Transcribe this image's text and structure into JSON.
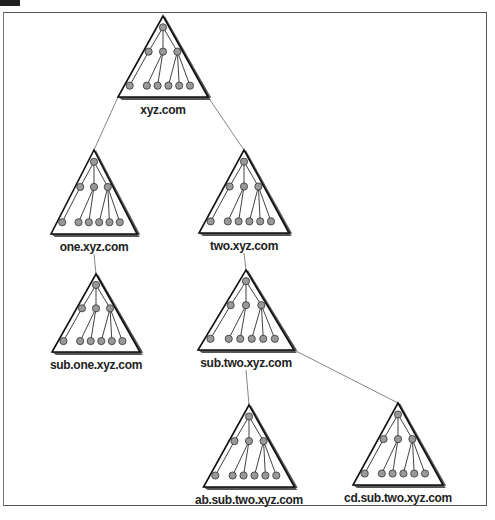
{
  "figure": {
    "colors": {
      "node_fill": "#999999",
      "line": "#111111",
      "shadow": "#555555",
      "connector": "#666666"
    }
  },
  "domains": [
    {
      "id": "xyz",
      "label": "xyz.com",
      "apex": [
        163,
        16
      ],
      "width": 90,
      "height": 81
    },
    {
      "id": "one",
      "label": "one.xyz.com",
      "apex": [
        94,
        150
      ],
      "width": 86,
      "height": 84
    },
    {
      "id": "two",
      "label": "two.xyz.com",
      "apex": [
        244,
        150
      ],
      "width": 90,
      "height": 83
    },
    {
      "id": "subone",
      "label": "sub.one.xyz.com",
      "apex": [
        96,
        274
      ],
      "width": 88,
      "height": 78
    },
    {
      "id": "subtwo",
      "label": "sub.two.xyz.com",
      "apex": [
        246,
        270
      ],
      "width": 96,
      "height": 80
    },
    {
      "id": "absub",
      "label": "ab.sub.two.xyz.com",
      "apex": [
        249,
        405
      ],
      "width": 91,
      "height": 82
    },
    {
      "id": "cdsub",
      "label": "cd.sub.two.xyz.com",
      "apex": [
        398,
        403
      ],
      "width": 90,
      "height": 82
    }
  ],
  "edges": [
    {
      "from": "xyz",
      "to": "one"
    },
    {
      "from": "xyz",
      "to": "two"
    },
    {
      "from": "one",
      "to": "subone"
    },
    {
      "from": "two",
      "to": "subtwo"
    },
    {
      "from": "subtwo",
      "to": "absub"
    },
    {
      "from": "subtwo",
      "to": "cdsub"
    }
  ],
  "inner_tree": {
    "levels": 3,
    "nodes_per_level": [
      1,
      3,
      6
    ],
    "description": "each zone triangle contains a root node with 3 children; children have 1, 2 and 3 leaf nodes"
  }
}
